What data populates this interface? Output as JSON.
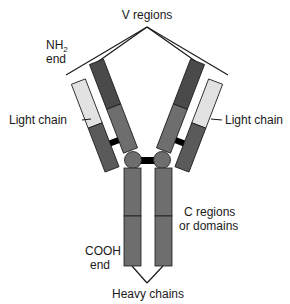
{
  "labels": {
    "v_regions": "V regions",
    "nh2_line1": "NH",
    "nh2_sub": "2",
    "nh2_line2": "end",
    "light_chain_left": "Light chain",
    "light_chain_right": "Light chain",
    "c_regions_line1": "C regions",
    "c_regions_line2": "or domains",
    "cooh_line1": "COOH",
    "cooh_line2": "end",
    "heavy_chains": "Heavy chains"
  },
  "colors": {
    "heavy_v": "#4a4a4a",
    "heavy_c": "#6e6e6e",
    "light_v": "#e2e2e2",
    "light_c": "#5a5a5a",
    "hinge": "#6e6e6e",
    "disulfide": "#000000",
    "outline": "#1a1a1a"
  }
}
